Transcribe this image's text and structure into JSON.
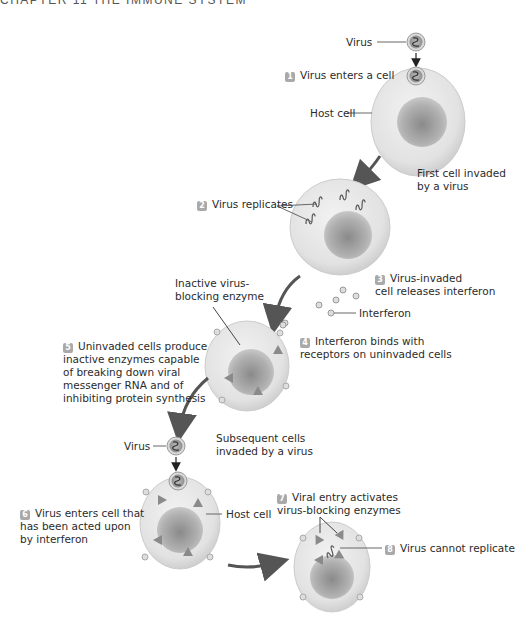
{
  "header": {
    "title": "CHAPTER 11   THE IMMUNE SYSTEM"
  },
  "labels": {
    "virus_top": "Virus",
    "host_cell_top": "Host cell",
    "first_cell": [
      "First cell invaded",
      "by a virus"
    ],
    "inactive_enzyme": [
      "Inactive virus-",
      "blocking enzyme"
    ],
    "interferon": "Interferon",
    "virus_mid": "Virus",
    "subsequent": [
      "Subsequent cells",
      "invaded by a virus"
    ],
    "host_cell_bottom": "Host cell"
  },
  "steps": [
    {
      "num": "1",
      "lines": [
        "Virus enters a cell"
      ]
    },
    {
      "num": "2",
      "lines": [
        "Virus replicates"
      ]
    },
    {
      "num": "3",
      "lines": [
        "Virus-invaded",
        "cell releases interferon"
      ]
    },
    {
      "num": "4",
      "lines": [
        "Interferon binds with",
        "receptors on uninvaded cells"
      ]
    },
    {
      "num": "5",
      "lines": [
        "Uninvaded cells produce",
        "inactive enzymes capable",
        "of breaking down viral",
        "messenger RNA and of",
        "inhibiting protein synthesis"
      ]
    },
    {
      "num": "6",
      "lines": [
        "Virus enters cell that",
        "has been acted upon",
        "by interferon"
      ]
    },
    {
      "num": "7",
      "lines": [
        "Viral entry activates",
        "virus-blocking enzymes"
      ]
    },
    {
      "num": "8",
      "lines": [
        "Virus cannot replicate"
      ]
    }
  ],
  "colors": {
    "cell_fill": "#e6e6e6",
    "cell_edge": "#c8c8c8",
    "nucleus": "#9a9a9a",
    "badge": "#a9a9a9",
    "arrow": "#555555",
    "enzyme": "#8a8a8a"
  }
}
